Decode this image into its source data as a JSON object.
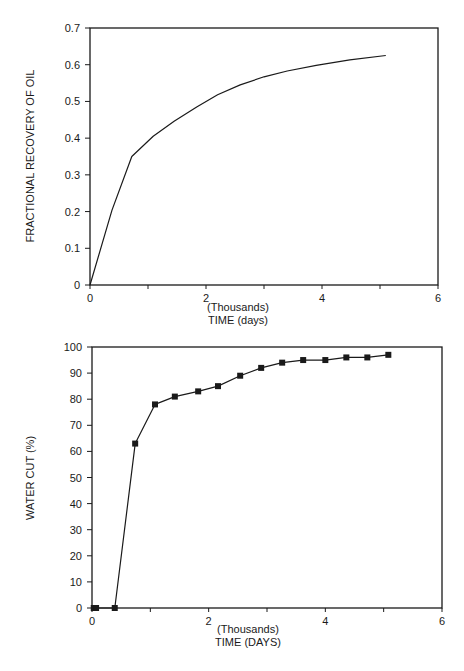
{
  "chart_data": [
    {
      "type": "line",
      "title": "",
      "xlabel_line1": "(Thousands)",
      "xlabel_line2": "TIME (days)",
      "ylabel": "FRACTIONAL RECOVERY OF OIL",
      "xlim": [
        0,
        6
      ],
      "ylim": [
        0,
        0.7
      ],
      "xticks": [
        0,
        2,
        4,
        6
      ],
      "xtick_labels": [
        "0",
        "2",
        "4",
        "6"
      ],
      "xminor_ticks": [
        1,
        3,
        5
      ],
      "yticks": [
        0,
        0.1,
        0.2,
        0.3,
        0.4,
        0.5,
        0.6,
        0.7
      ],
      "ytick_labels": [
        "0",
        "0.1",
        "0.2",
        "0.3",
        "0.4",
        "0.5",
        "0.6",
        "0.7"
      ],
      "grid": false,
      "markers": false,
      "series": [
        {
          "name": "Fractional recovery of oil",
          "x": [
            0,
            0.38,
            0.72,
            1.09,
            1.45,
            1.84,
            2.2,
            2.59,
            3.0,
            3.4,
            3.9,
            4.48,
            5.1
          ],
          "y": [
            0,
            0.204,
            0.35,
            0.405,
            0.446,
            0.485,
            0.518,
            0.545,
            0.567,
            0.583,
            0.598,
            0.613,
            0.625
          ]
        }
      ]
    },
    {
      "type": "line",
      "title": "",
      "xlabel_line1": "(Thousands)",
      "xlabel_line2": "TIME (DAYS)",
      "ylabel": "WATER CUT (%)",
      "xlim": [
        0,
        6
      ],
      "ylim": [
        0,
        100
      ],
      "xticks": [
        0,
        2,
        4,
        6
      ],
      "xtick_labels": [
        "0",
        "2",
        "4",
        "6"
      ],
      "xminor_ticks": [
        1,
        3,
        5
      ],
      "yticks": [
        0,
        10,
        20,
        30,
        40,
        50,
        60,
        70,
        80,
        90,
        100
      ],
      "ytick_labels": [
        "0",
        "10",
        "20",
        "30",
        "40",
        "50",
        "60",
        "70",
        "80",
        "90",
        "100"
      ],
      "grid": false,
      "markers": true,
      "marker_shape": "square",
      "series": [
        {
          "name": "Water cut",
          "x": [
            0.03,
            0.07,
            0.39,
            0.74,
            1.08,
            1.42,
            1.82,
            2.16,
            2.54,
            2.9,
            3.26,
            3.62,
            4.0,
            4.36,
            4.72,
            5.08
          ],
          "y": [
            0,
            0,
            0,
            63,
            78,
            81,
            83,
            85,
            89,
            92,
            94,
            95,
            95,
            96,
            96,
            97
          ]
        }
      ]
    }
  ],
  "colors": {
    "line": "#1a1a1a",
    "background": "#ffffff"
  }
}
